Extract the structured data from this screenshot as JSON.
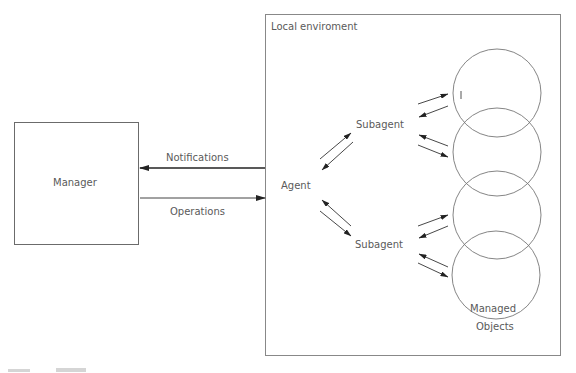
{
  "diagram": {
    "type": "block-diagram",
    "manager": {
      "label": "Manager"
    },
    "environment": {
      "label": "Local enviroment"
    },
    "links": {
      "notifications": "Notifications",
      "operations": "Operations"
    },
    "agent": {
      "label": "Agent"
    },
    "subagents": [
      {
        "label": "Subagent"
      },
      {
        "label": "Subagent"
      }
    ],
    "managed_objects": {
      "label_line1": "Managed",
      "label_line2": "Objects",
      "count": 4
    },
    "colors": {
      "line": "#333333",
      "border": "#6b6b6b",
      "text": "#5a5a5a",
      "background": "#ffffff"
    }
  }
}
